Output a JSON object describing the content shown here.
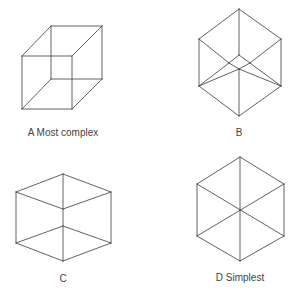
{
  "diagram": {
    "colors": {
      "line": "#3a3a3a",
      "text": "#444444",
      "background": "#ffffff"
    },
    "figures": [
      {
        "id": "A",
        "label": "A  Most complex",
        "label_pos": [
          63,
          133
        ],
        "description": "Oblique wireframe cube (Necker cube)",
        "edges": [
          [
            22,
            56,
            72,
            56
          ],
          [
            72,
            56,
            72,
            109
          ],
          [
            72,
            109,
            22,
            109
          ],
          [
            22,
            109,
            22,
            56
          ],
          [
            51,
            26,
            102,
            26
          ],
          [
            102,
            26,
            102,
            79
          ],
          [
            102,
            79,
            51,
            79
          ],
          [
            51,
            79,
            51,
            26
          ],
          [
            22,
            56,
            51,
            26
          ],
          [
            72,
            56,
            102,
            26
          ],
          [
            72,
            109,
            102,
            79
          ],
          [
            22,
            109,
            51,
            79
          ]
        ]
      },
      {
        "id": "B",
        "label": "B",
        "label_pos": [
          239,
          133
        ],
        "description": "Near-isometric wireframe cube with small inner diamond",
        "edges": [
          [
            239,
            9,
            281,
            39
          ],
          [
            281,
            39,
            281,
            86
          ],
          [
            281,
            86,
            239,
            116
          ],
          [
            239,
            116,
            199,
            86
          ],
          [
            199,
            86,
            199,
            39
          ],
          [
            199,
            39,
            239,
            9
          ],
          [
            239,
            9,
            239,
            55
          ],
          [
            199,
            39,
            229,
            63
          ],
          [
            281,
            39,
            250,
            63
          ],
          [
            199,
            86,
            239,
            69
          ],
          [
            281,
            86,
            239,
            69
          ],
          [
            239,
            116,
            239,
            69
          ],
          [
            239,
            55,
            229,
            63
          ],
          [
            239,
            55,
            250,
            63
          ],
          [
            229,
            63,
            239,
            69
          ],
          [
            250,
            63,
            239,
            69
          ],
          [
            229,
            63,
            199,
            86
          ],
          [
            250,
            63,
            281,
            86
          ]
        ]
      },
      {
        "id": "C",
        "label": "C",
        "label_pos": [
          63,
          279
        ],
        "description": "Isometric wireframe cube with slightly offset center vertices",
        "edges": [
          [
            63,
            174,
            111,
            192
          ],
          [
            111,
            192,
            111,
            243
          ],
          [
            111,
            243,
            63,
            261
          ],
          [
            63,
            261,
            16,
            243
          ],
          [
            16,
            243,
            16,
            192
          ],
          [
            16,
            192,
            63,
            174
          ],
          [
            16,
            192,
            63,
            209
          ],
          [
            111,
            192,
            63,
            209
          ],
          [
            63,
            174,
            63,
            261
          ],
          [
            16,
            243,
            63,
            226
          ],
          [
            111,
            243,
            63,
            226
          ]
        ]
      },
      {
        "id": "D",
        "label": "D  Simplest",
        "label_pos": [
          240,
          278
        ],
        "description": "Perfect isometric wireframe cube – hexagon with coincident center vertices",
        "edges": [
          [
            240,
            157,
            284,
            184
          ],
          [
            284,
            184,
            284,
            236
          ],
          [
            284,
            236,
            240,
            261
          ],
          [
            240,
            261,
            197,
            236
          ],
          [
            197,
            236,
            197,
            184
          ],
          [
            197,
            184,
            240,
            157
          ],
          [
            240,
            157,
            240,
            261
          ],
          [
            197,
            184,
            284,
            236
          ],
          [
            284,
            184,
            197,
            236
          ]
        ]
      }
    ]
  }
}
